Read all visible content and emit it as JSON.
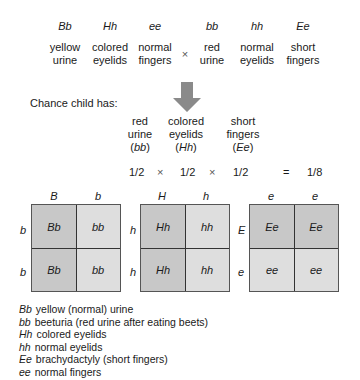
{
  "parent1": {
    "genotypes": [
      "Bb",
      "Hh",
      "ee"
    ],
    "traits": [
      [
        "yellow",
        "urine"
      ],
      [
        "colored",
        "eyelids"
      ],
      [
        "normal",
        "fingers"
      ]
    ]
  },
  "cross_symbol": "×",
  "parent2": {
    "genotypes": [
      "bb",
      "hh",
      "Ee"
    ],
    "traits": [
      [
        "red",
        "urine"
      ],
      [
        "normal",
        "eyelids"
      ],
      [
        "short",
        "fingers"
      ]
    ]
  },
  "chance": {
    "heading": "Chance child has:",
    "columns": [
      {
        "lines": [
          "red",
          "urine"
        ],
        "genotype": "bb"
      },
      {
        "lines": [
          "colored",
          "eyelids"
        ],
        "genotype": "Hh"
      },
      {
        "lines": [
          "short",
          "fingers"
        ],
        "genotype": "Ee"
      }
    ],
    "probabilities": [
      "1/2",
      "1/2",
      "1/2"
    ],
    "times": "×",
    "equals": "=",
    "result": "1/8"
  },
  "punnett": [
    {
      "top": [
        "B",
        "b"
      ],
      "side": [
        "b",
        "b"
      ],
      "cells": [
        [
          "Bb",
          "bb"
        ],
        [
          "Bb",
          "bb"
        ]
      ]
    },
    {
      "top": [
        "H",
        "h"
      ],
      "side": [
        "h",
        "h"
      ],
      "cells": [
        [
          "Hh",
          "hh"
        ],
        [
          "Hh",
          "hh"
        ]
      ]
    },
    {
      "top": [
        "e",
        "e"
      ],
      "side": [
        "E",
        "e"
      ],
      "cells": [
        [
          "Ee",
          "Ee"
        ],
        [
          "ee",
          "ee"
        ]
      ]
    }
  ],
  "legend": [
    {
      "g": "Bb",
      "text": "yellow (normal) urine"
    },
    {
      "g": "bb",
      "text": "beeturia (red urine after eating beets)"
    },
    {
      "g": "Hh",
      "text": "colored eyelids"
    },
    {
      "g": "hh",
      "text": "normal eyelids"
    },
    {
      "g": "Ee",
      "text": "brachydactyly (short fingers)"
    },
    {
      "g": "ee",
      "text": "normal fingers"
    }
  ],
  "colors": {
    "dominant_cell": "#c8c8c8",
    "recessive_cell": "#dedede",
    "arrow": "#8a8a8a"
  }
}
